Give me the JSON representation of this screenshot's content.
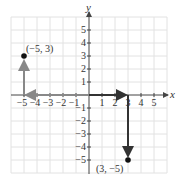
{
  "diagram": {
    "type": "coordinate-plane",
    "axes": {
      "x_label": "x",
      "y_label": "y",
      "x_ticks": [
        "−5",
        "−4",
        "−3",
        "−2",
        "−1",
        "1",
        "2",
        "3",
        "4",
        "5"
      ],
      "y_ticks": [
        "5",
        "4",
        "3",
        "2",
        "1",
        "−1",
        "−2",
        "−3",
        "−4",
        "−5"
      ],
      "range": [
        -6,
        6
      ]
    },
    "points": [
      {
        "label": "(−5, 3)",
        "x": -5,
        "y": 3
      },
      {
        "label": "(3, −5)",
        "x": 3,
        "y": -5
      }
    ],
    "paths": [
      {
        "name": "path-to-neg5-3",
        "steps": [
          [
            0,
            0
          ],
          [
            -5,
            0
          ],
          [
            -5,
            3
          ]
        ],
        "color": "#888888"
      },
      {
        "name": "path-to-3-neg5",
        "steps": [
          [
            0,
            0
          ],
          [
            3,
            0
          ],
          [
            3,
            -5
          ]
        ],
        "color": "#333333"
      }
    ],
    "colors": {
      "grid": "#e2e2e2",
      "axis": "#444444",
      "point": "#111111"
    }
  }
}
